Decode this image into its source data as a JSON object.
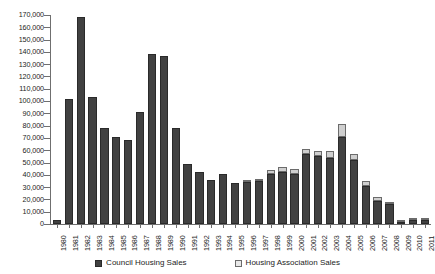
{
  "chart_data": {
    "type": "bar",
    "barmode": "stacked",
    "title": "",
    "subtitle": "",
    "xlabel": "",
    "ylabel": "",
    "ylim": [
      0,
      170000
    ],
    "ytick_step": 10000,
    "grid": false,
    "legend_position": "bottom",
    "categories": [
      "1980",
      "1981",
      "1982",
      "1983",
      "1984",
      "1985",
      "1986",
      "1987",
      "1988",
      "1989",
      "1990",
      "1991",
      "1992",
      "1993",
      "1994",
      "1995",
      "1996",
      "1997",
      "1998",
      "1999",
      "2000",
      "2001",
      "2002",
      "2003",
      "2004",
      "2005",
      "2006",
      "2007",
      "2008",
      "2009",
      "2010",
      "2011"
    ],
    "ytick_labels": [
      "0",
      "10,000",
      "20,000",
      "30,000",
      "40,000",
      "50,000",
      "60,000",
      "70,000",
      "80,000",
      "90,000",
      "100,000",
      "110,000",
      "120,000",
      "130,000",
      "140,000",
      "150,000",
      "160,000",
      "170,000"
    ],
    "ytick_values": [
      0,
      10000,
      20000,
      30000,
      40000,
      50000,
      60000,
      70000,
      80000,
      90000,
      100000,
      110000,
      120000,
      130000,
      140000,
      150000,
      160000,
      170000
    ],
    "series": [
      {
        "name": "Council Housing Sales",
        "color": "#414141",
        "values": [
          3000,
          102000,
          168000,
          103000,
          78000,
          71000,
          68000,
          91000,
          138000,
          137000,
          78000,
          49000,
          42000,
          36000,
          41000,
          33000,
          34000,
          35000,
          41000,
          42000,
          41000,
          57000,
          55000,
          54000,
          71000,
          52000,
          31000,
          19000,
          16000,
          2000,
          3500,
          3500
        ]
      },
      {
        "name": "Housing Association Sales",
        "color": "#cfcfcf",
        "values": [
          0,
          0,
          0,
          0,
          0,
          0,
          0,
          0,
          0,
          0,
          0,
          0,
          0,
          0,
          0,
          0,
          1000,
          2000,
          3000,
          4000,
          4000,
          4000,
          4000,
          5000,
          10000,
          5000,
          4000,
          3000,
          2000,
          300,
          500,
          500
        ]
      }
    ],
    "totals": [
      3000,
      102000,
      168000,
      103000,
      78000,
      71000,
      68000,
      91000,
      138000,
      137000,
      78000,
      49000,
      42000,
      36000,
      41000,
      33000,
      35000,
      37000,
      44000,
      46000,
      45000,
      61000,
      59000,
      59000,
      81000,
      57000,
      35000,
      22000,
      18000,
      2300,
      4000,
      4000
    ]
  },
  "legend": {
    "entries": [
      {
        "label": "Council Housing Sales",
        "swatch": "legend-swatch-council",
        "color": "#414141"
      },
      {
        "label": "Housing Association Sales",
        "swatch": "legend-swatch-housing-association",
        "color": "#e8e8e8"
      }
    ]
  }
}
